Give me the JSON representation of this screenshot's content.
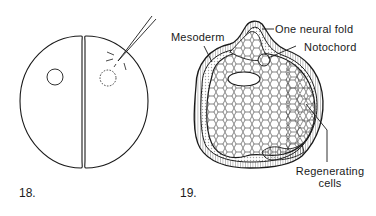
{
  "figures": [
    {
      "number": "18.",
      "description": "Two-cell stage embryo with nucleus in each blastomere; microneedle pricking right blastomere",
      "elements": {
        "left_nucleus": "solid-circle",
        "right_nucleus": "dashed-circle",
        "needle": "micro-needle"
      }
    },
    {
      "number": "19.",
      "description": "Cross-section of half-embryo showing regeneration",
      "labels": {
        "neural_fold": "One neural fold",
        "mesoderm": "Mesoderm",
        "notochord": "Notochord",
        "regenerating_line1": "Regenerating",
        "regenerating_line2": "cells"
      }
    }
  ],
  "colors": {
    "ink": "#1a1a1a",
    "background": "#ffffff"
  }
}
